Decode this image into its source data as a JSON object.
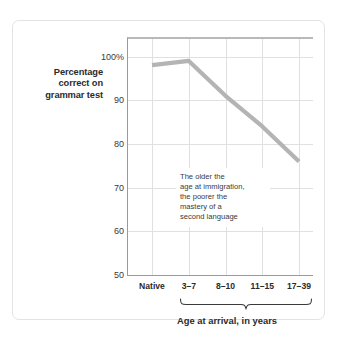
{
  "figure": {
    "y_axis_title_lines": [
      "Percentage",
      "correct on",
      "grammar test"
    ],
    "annotation_lines": [
      "The older the",
      "age at immigration,",
      "the poorer the",
      "mastery of a",
      "second language"
    ],
    "annotation_text": "The older the age at immigration, the poorer the mastery of a second language",
    "x_axis_title": "Age at arrival, in years",
    "colors": {
      "line": "#b4b4b4",
      "grid": "#e0e0e0",
      "axis": "#9a9a9a",
      "card_border": "#e3e3e3",
      "text": "#2b2b2b",
      "background": "#ffffff"
    }
  },
  "chart_data": {
    "type": "line",
    "title": "",
    "xlabel": "Age at arrival, in years",
    "ylabel": "Percentage correct on grammar test",
    "categories": [
      "Native",
      "3–7",
      "8–10",
      "11–15",
      "17–39"
    ],
    "series": [
      {
        "name": "Percentage correct on grammar test",
        "values": [
          98,
          99,
          91,
          84,
          76
        ]
      }
    ],
    "ylim": [
      50,
      104
    ],
    "yticks": [
      50,
      60,
      70,
      80,
      90,
      100
    ],
    "ytick_labels": [
      "50",
      "60",
      "70",
      "80",
      "90",
      "100%"
    ],
    "grid": true,
    "legend": "none",
    "annotations": [
      {
        "text": "The older the age at immigration, the poorer the mastery of a second language",
        "x_category": "8–10",
        "y_value": 78
      }
    ]
  }
}
